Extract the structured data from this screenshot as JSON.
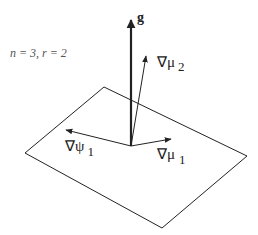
{
  "annotation": "n = 3, r = 2",
  "vectors": {
    "g": {
      "label": "g"
    },
    "grad_mu2": {
      "label": "∇μ",
      "subscript": "2"
    },
    "grad_psi1": {
      "label": "∇ψ",
      "subscript": "1"
    },
    "grad_mu1": {
      "label": "∇μ",
      "subscript": "1"
    }
  },
  "colors": {
    "stroke": "#222222",
    "background": "#ffffff"
  }
}
